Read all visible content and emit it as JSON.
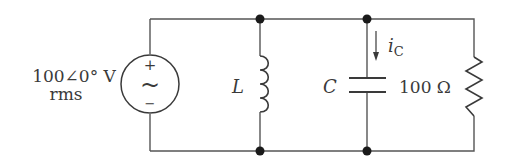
{
  "source": {
    "value_label": "100∠0° V",
    "unit_label": "rms",
    "plus_sign": "+",
    "minus_sign": "−",
    "ac_symbol": "~"
  },
  "inductor": {
    "label": "L"
  },
  "capacitor": {
    "label": "C",
    "current_label": "i",
    "current_subscript": "C"
  },
  "resistor": {
    "label": "100 Ω"
  },
  "colors": {
    "wire": "#555555",
    "node": "#1a1a1a",
    "text": "#3a3a3a"
  }
}
